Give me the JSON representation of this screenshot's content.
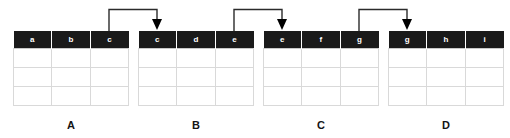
{
  "diagram": {
    "type": "join-chain-diagram",
    "background_color": "#ffffff",
    "header_color": "#1a1a1a",
    "header_text_color": "#ffffff",
    "grid_line_color": "#d9d9d9",
    "connector_color": "#2b2b2b",
    "tables": [
      {
        "id": "a",
        "caption": "A",
        "columns": [
          "a",
          "b",
          "c"
        ],
        "body_rows": 3
      },
      {
        "id": "b",
        "caption": "B",
        "columns": [
          "c",
          "d",
          "e"
        ],
        "body_rows": 3
      },
      {
        "id": "c",
        "caption": "C",
        "columns": [
          "e",
          "f",
          "g"
        ],
        "body_rows": 3
      },
      {
        "id": "d",
        "caption": "D",
        "columns": [
          "g",
          "h",
          "i"
        ],
        "body_rows": 3
      }
    ],
    "connectors": [
      {
        "id": "a-c-to-b-c",
        "from_table": "A",
        "from_column": "c",
        "to_table": "B",
        "to_column": "c",
        "arrowhead": "down-triangle"
      },
      {
        "id": "b-e-to-c-e",
        "from_table": "B",
        "from_column": "e",
        "to_table": "C",
        "to_column": "e",
        "arrowhead": "down-triangle"
      },
      {
        "id": "c-g-to-d-g",
        "from_table": "C",
        "from_column": "g",
        "to_table": "D",
        "to_column": "g",
        "arrowhead": "down-triangle"
      }
    ]
  }
}
